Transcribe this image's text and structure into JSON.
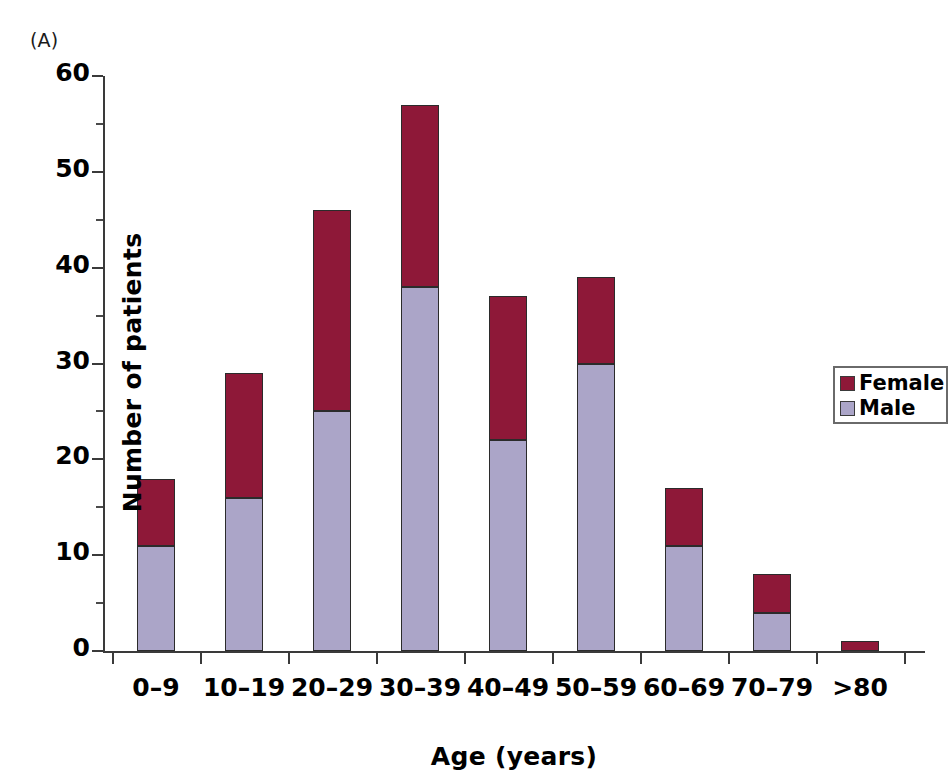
{
  "panel": {
    "label": "(A)"
  },
  "legend": {
    "entries": [
      {
        "label": "Female",
        "color": "#8E1838",
        "key": "female"
      },
      {
        "label": "Male",
        "color": "#ABA5C8",
        "key": "male"
      }
    ]
  },
  "axes": {
    "y_title": "Number of patients",
    "x_title": "Age (years)",
    "y_ticks": [
      "0",
      "10",
      "20",
      "30",
      "40",
      "50",
      "60"
    ]
  },
  "chart_data": {
    "type": "bar",
    "title": "",
    "subtitle": "",
    "panel_label": "(A)",
    "stacked": true,
    "orientation": "vertical",
    "xlabel": "Age (years)",
    "ylabel": "Number of patients",
    "ylim": [
      0,
      60
    ],
    "ytick_step": 10,
    "yminor_tick_step": 5,
    "grid": false,
    "legend_position": "right-inside",
    "categories": [
      "0–9",
      "10–19",
      "20–29",
      "30–39",
      "40–49",
      "50–59",
      "60–69",
      "70–79",
      ">80"
    ],
    "series": [
      {
        "name": "Male",
        "color": "#ABA5C8",
        "values": [
          11,
          16,
          25,
          38,
          22,
          30,
          11,
          4,
          0
        ]
      },
      {
        "name": "Female",
        "color": "#8E1838",
        "values": [
          7,
          13,
          21,
          19,
          15,
          9,
          6,
          4,
          1
        ]
      }
    ],
    "totals": [
      18,
      29,
      46,
      57,
      37,
      39,
      17,
      8,
      1
    ]
  }
}
